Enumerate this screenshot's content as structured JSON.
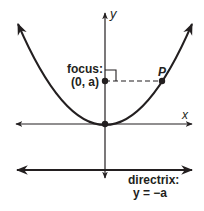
{
  "diagram": {
    "title": "",
    "labels": {
      "y_axis": "y",
      "x_axis": "x",
      "focus_line1": "focus:",
      "focus_line2": "(0, a)",
      "point_p": "P",
      "directrix_line1": "directrix:",
      "directrix_line2": "y = −a"
    },
    "elements": {
      "parabola": "upward-opening parabola with vertex at origin",
      "vertex": "(0, 0)",
      "focus": "(0, a)",
      "directrix": "y = −a",
      "point_on_parabola": "P"
    },
    "colors": {
      "stroke": "#231f20",
      "background": "#ffffff"
    }
  }
}
